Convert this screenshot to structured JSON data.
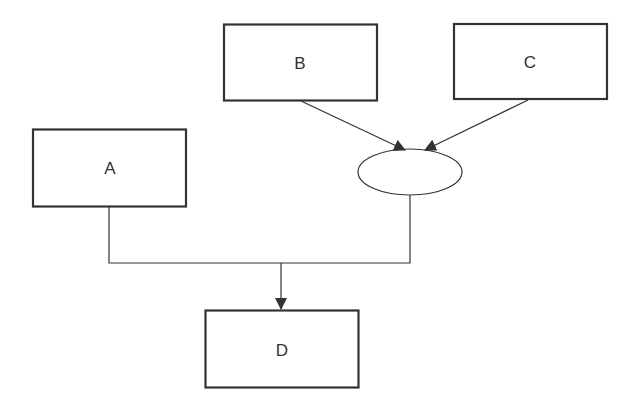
{
  "diagram": {
    "type": "flowchart",
    "colors": {
      "stroke": "#333333",
      "text": "#333333",
      "background": "#ffffff",
      "fill": "#ffffff"
    },
    "nodes": [
      {
        "id": "A",
        "label": "A",
        "shape": "rectangle"
      },
      {
        "id": "B",
        "label": "B",
        "shape": "rectangle"
      },
      {
        "id": "C",
        "label": "C",
        "shape": "rectangle"
      },
      {
        "id": "junction",
        "label": "",
        "shape": "ellipse"
      },
      {
        "id": "D",
        "label": "D",
        "shape": "rectangle"
      }
    ],
    "edges": [
      {
        "from": "B",
        "to": "junction",
        "arrow": true
      },
      {
        "from": "C",
        "to": "junction",
        "arrow": true
      },
      {
        "from": "A",
        "to": "D",
        "arrow": true,
        "merged": true
      },
      {
        "from": "junction",
        "to": "D",
        "arrow": true,
        "merged": true
      }
    ]
  }
}
